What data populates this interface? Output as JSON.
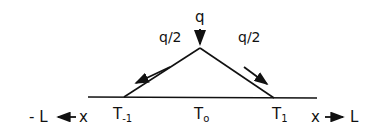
{
  "diagram": {
    "type": "heat-source triangle diagram",
    "labels": {
      "q_top": "q",
      "q_half_left": "q/2",
      "q_half_right": "q/2",
      "t_minus1_base": "T",
      "t_minus1_sub": "-1",
      "t0_base": "T",
      "t0_sub": "o",
      "t1_base": "T",
      "t1_sub": "1",
      "left_axis": "- L ◄— x",
      "left_axis_minus_L": "- L",
      "left_axis_x": "x",
      "right_axis_x": "x",
      "right_axis_L": "L"
    },
    "colors": {
      "ink": "#111111",
      "background": "#ffffff"
    }
  }
}
